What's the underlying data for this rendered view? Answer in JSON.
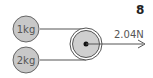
{
  "problem_number": "8",
  "masses": [
    {
      "label": "1kg"
    },
    {
      "label": "2kg"
    }
  ],
  "force": {
    "label": "2.04N",
    "direction": "right"
  },
  "colors": {
    "mass_fill": "#c8c8c8",
    "stroke": "#555555",
    "pulley_fill": "#cfcfcf"
  }
}
